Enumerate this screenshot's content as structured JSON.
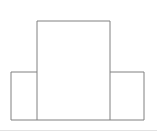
{
  "figure": {
    "background_color": "#ffffff",
    "stroke_color": "#808080",
    "fill_color": "#ffffff",
    "stroke_width": 1,
    "canvas": {
      "width": 157,
      "height": 137
    },
    "outline_path": "M 11 120 L 11 72 L 37 72 L 37 21 L 110 21 L 110 72 L 144 72 L 144 120 Z",
    "blocks": [
      {
        "name": "left-block",
        "label": "Left low block",
        "x": 11,
        "y": 72,
        "width": 26,
        "height": 48
      },
      {
        "name": "center-block",
        "label": "Center tall block",
        "x": 11,
        "y": 21,
        "width": 99,
        "height": 99
      },
      {
        "name": "right-block",
        "label": "Right low block",
        "x": 110,
        "y": 72,
        "width": 34,
        "height": 48
      }
    ],
    "inner_edges": [
      {
        "name": "left-inner-divider",
        "x1": 37,
        "y1": 72,
        "x2": 37,
        "y2": 120
      },
      {
        "name": "right-inner-divider",
        "x1": 110,
        "y1": 72,
        "x2": 110,
        "y2": 120
      },
      {
        "name": "center-left-shoulder",
        "x1": 11,
        "y1": 72,
        "x2": 37,
        "y2": 72
      },
      {
        "name": "center-right-shoulder",
        "x1": 110,
        "y1": 72,
        "x2": 144,
        "y2": 72
      }
    ],
    "footer_rule": {
      "name": "footer-separator",
      "color": "#e2e2e2",
      "x1": 0,
      "y1": 130.5,
      "x2": 157,
      "y2": 130.5
    }
  }
}
